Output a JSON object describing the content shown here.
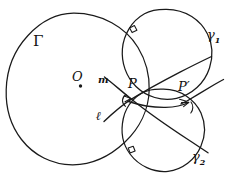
{
  "figure": {
    "kind": "hand-drawn-geometry-diagram",
    "background_color": "#ffffff",
    "ink_color": "#1a1a1a",
    "width": 235,
    "height": 178,
    "labels": {
      "big_circle": "Γ",
      "center_point": "O",
      "line_m": "m",
      "line_l": "ℓ",
      "point_p": "P",
      "point_p_prime": "P′",
      "circle_gamma_1": "γ",
      "circle_gamma_1_sub": "1",
      "circle_gamma_2": "γ",
      "circle_gamma_2_sub": "2"
    },
    "elements": {
      "big_circle_name": "Γ",
      "center_name": "O",
      "small_circle_1_name": "γ₁",
      "small_circle_2_name": "γ₂",
      "intersection_1_name": "P",
      "intersection_2_name": "P′",
      "line_1_name": "m",
      "line_2_name": "ℓ",
      "right_angle_markers": 2,
      "angle_arc_markers": 2
    },
    "geometry": {
      "big_circle": {
        "cx": 73,
        "cy": 89,
        "r": 76
      },
      "circle_gamma_1": {
        "cx": 166,
        "cy": 54,
        "r": 45
      },
      "circle_gamma_2": {
        "cx": 163,
        "cy": 130,
        "r": 41
      },
      "point_p": {
        "x": 131,
        "y": 99
      },
      "point_p_prime": {
        "x": 187,
        "y": 101
      },
      "center_o": {
        "x": 80,
        "y": 86
      }
    }
  }
}
